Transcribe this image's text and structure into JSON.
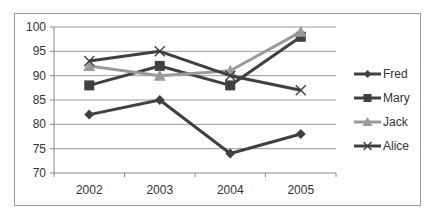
{
  "chart_data": {
    "type": "line",
    "title": "",
    "xlabel": "",
    "ylabel": "",
    "categories": [
      "2002",
      "2003",
      "2004",
      "2005"
    ],
    "series": [
      {
        "name": "Fred",
        "values": [
          82,
          85,
          74,
          78
        ],
        "color": "#404040",
        "marker": "diamond"
      },
      {
        "name": "Mary",
        "values": [
          88,
          92,
          88,
          98
        ],
        "color": "#404040",
        "marker": "square"
      },
      {
        "name": "Jack",
        "values": [
          92,
          90,
          91,
          99
        ],
        "color": "#9a9a9a",
        "marker": "triangle"
      },
      {
        "name": "Alice",
        "values": [
          93,
          95,
          90,
          87
        ],
        "color": "#404040",
        "marker": "x"
      }
    ],
    "ylim": [
      70,
      100
    ],
    "yticks": [
      70,
      75,
      80,
      85,
      90,
      95,
      100
    ],
    "grid": true,
    "legend_position": "right"
  }
}
